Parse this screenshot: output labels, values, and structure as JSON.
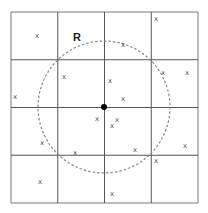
{
  "diagram": {
    "radius_label": "R",
    "grid": {
      "cols": 4,
      "rows": 4,
      "x0": 11,
      "y0": 12,
      "cell_w": 46.75,
      "cell_h": 47.75
    },
    "center": {
      "x": 104,
      "y": 107
    },
    "circle_radius": 66,
    "marker_glyph": "x",
    "points": [
      {
        "x": 37,
        "y": 35
      },
      {
        "x": 156,
        "y": 18
      },
      {
        "x": 123,
        "y": 44
      },
      {
        "x": 64,
        "y": 76
      },
      {
        "x": 15,
        "y": 96
      },
      {
        "x": 110,
        "y": 80
      },
      {
        "x": 163,
        "y": 72
      },
      {
        "x": 187,
        "y": 72
      },
      {
        "x": 123,
        "y": 98
      },
      {
        "x": 97,
        "y": 118
      },
      {
        "x": 117,
        "y": 119
      },
      {
        "x": 112,
        "y": 125
      },
      {
        "x": 42,
        "y": 142
      },
      {
        "x": 75,
        "y": 152
      },
      {
        "x": 135,
        "y": 149
      },
      {
        "x": 185,
        "y": 145
      },
      {
        "x": 156,
        "y": 160
      },
      {
        "x": 40,
        "y": 181
      },
      {
        "x": 112,
        "y": 193
      }
    ],
    "colors": {
      "grid": "#555555",
      "circle": "#888888",
      "center": "#000000"
    }
  }
}
